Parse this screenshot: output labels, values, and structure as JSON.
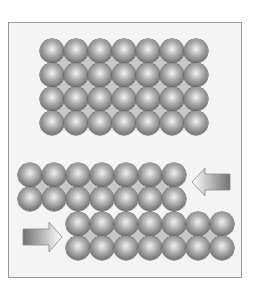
{
  "diagram": {
    "colors": {
      "frame_border": "#9a9a9a",
      "frame_bg": "#f4f4f4",
      "atom_dark": "#4a4a4a",
      "atom_light": "#f2f2f2",
      "interstitial": "#c8c8c8"
    },
    "top_lattice": {
      "rows": 4,
      "cols": 7,
      "origin": [
        40,
        39
      ],
      "pitch": 24
    },
    "bottom_lattice": {
      "upper_block": {
        "rows": 2,
        "cols": 7,
        "origin": [
          18,
          163
        ],
        "pitch": 24
      },
      "lower_block": {
        "rows": 2,
        "cols": 7,
        "origin": [
          66,
          212
        ],
        "pitch": 24
      }
    },
    "arrows": [
      {
        "name": "left-pointing-arrow",
        "direction": "left",
        "applies_to": "upper_block"
      },
      {
        "name": "right-pointing-arrow",
        "direction": "right",
        "applies_to": "lower_block"
      }
    ]
  }
}
